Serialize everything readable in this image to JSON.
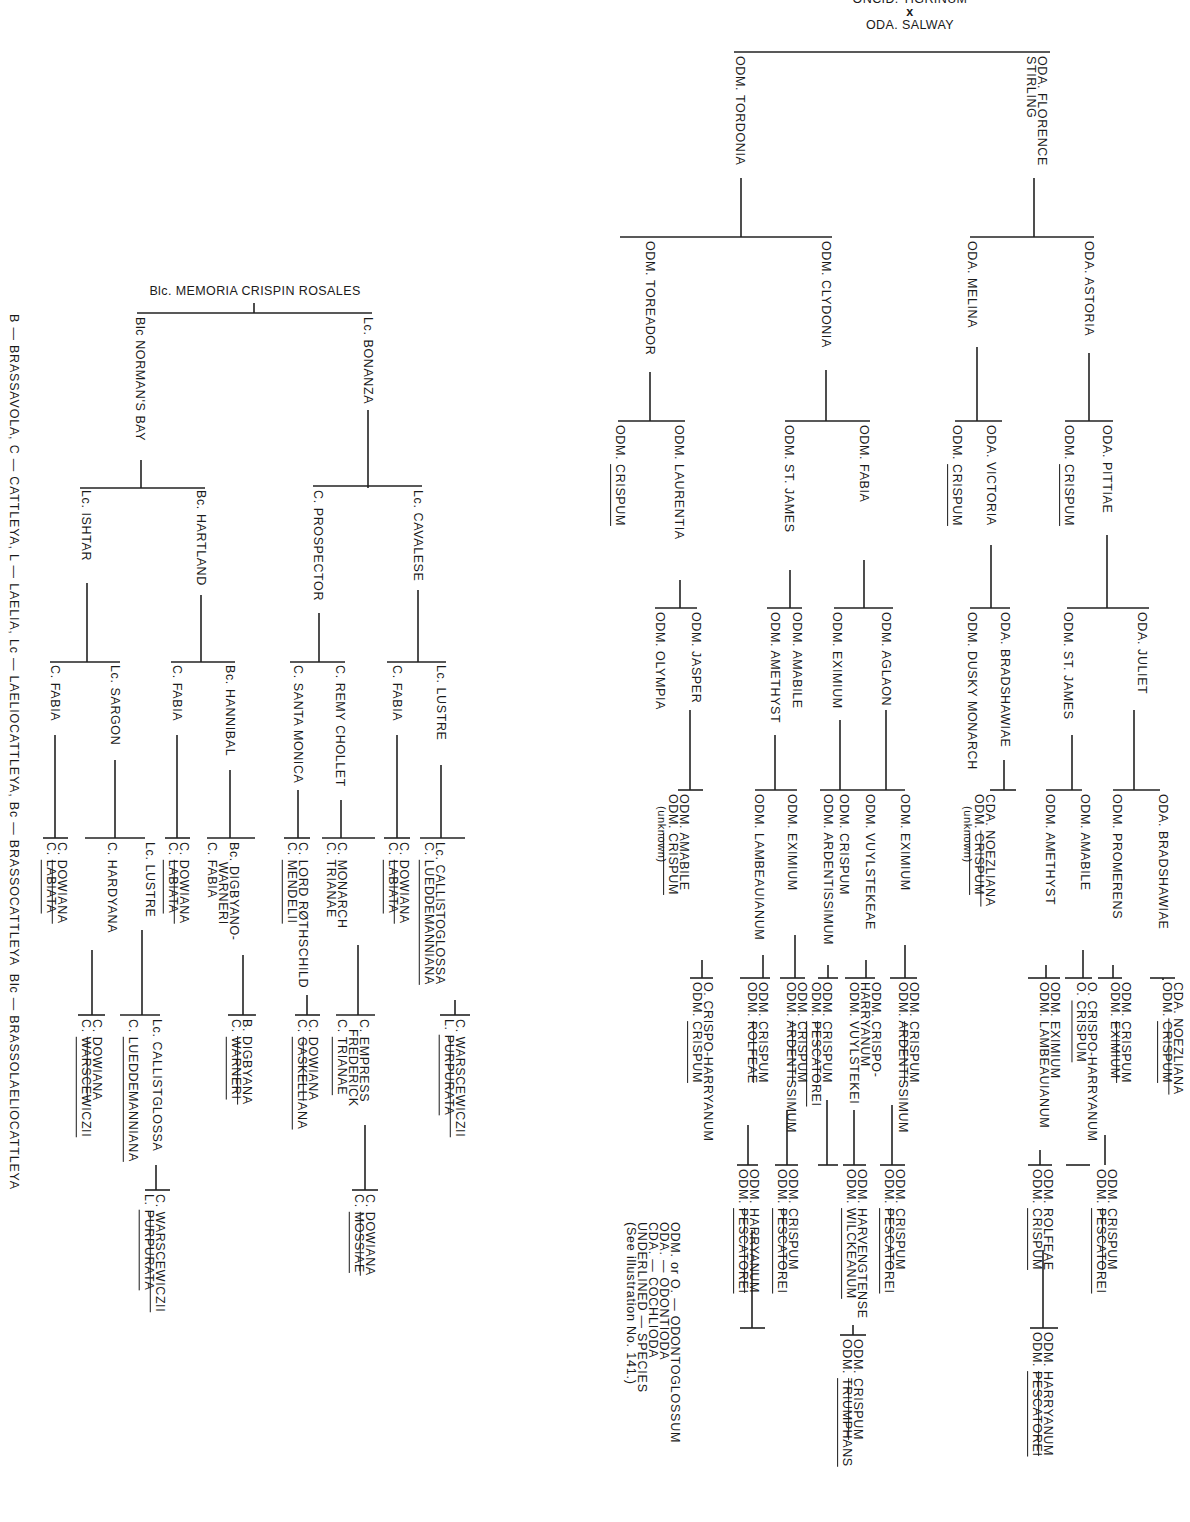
{
  "right_tree": {
    "title_top": "ONCID. TIGRINUM",
    "cross_symbol": "x",
    "title_bottom": "ODA. SALWAY",
    "gen1": [
      {
        "label": "ODA. FLORENCE\nSTIRLING"
      },
      {
        "label": "ODM. TORDONIA"
      }
    ],
    "gen2": [
      {
        "label": "ODA. ASTORIA"
      },
      {
        "label": "ODA. MELINA"
      },
      {
        "label": "ODM. CLYDONIA"
      },
      {
        "label": "ODM. TOREADOR"
      }
    ],
    "gen3": [
      {
        "label": "ODA. PITTIAE"
      },
      {
        "prefix": "ODM. ",
        "species": "CRISPUM"
      },
      {
        "label": "ODA. VICTORIA"
      },
      {
        "prefix": "ODM. ",
        "species": "CRISPUM"
      },
      {
        "label": "ODM. FABIA"
      },
      {
        "label": "ODM. ST. JAMES"
      },
      {
        "label": "ODM. LAURENTIA"
      },
      {
        "prefix": "ODM. ",
        "species": "CRISPUM"
      }
    ],
    "gen4": [
      {
        "label": "ODA. JULIET"
      },
      {
        "label": "ODM. ST. JAMES"
      },
      {
        "label": "ODA. BRADSHAWIAE"
      },
      {
        "label": "ODM. DUSKY MONARCH"
      },
      {
        "label": "ODM. AGLAON"
      },
      {
        "label": "ODM. EXIMIUM"
      },
      {
        "label": "ODM. AMABILE"
      },
      {
        "label": "ODM. AMETHYST"
      },
      {
        "label": "ODM. JASPER"
      },
      {
        "label": "ODM. OLYMPIA"
      }
    ],
    "gen5": [
      {
        "label": "ODA. BRADSHAWIAE"
      },
      {
        "label": "ODM. PROMERENS"
      },
      {
        "label": "ODM. AMABILE"
      },
      {
        "label": "ODM. AMETHYST"
      },
      {
        "line1_prefix": "CDA. ",
        "line1_species": "NOEZLIANA",
        "line2_prefix": "ODM. ",
        "line2_species": "CRISPUM",
        "note": "(unknown)"
      },
      {
        "label": "ODM. EXIMIUM"
      },
      {
        "label": "ODM. VUYLSTEKEAE"
      },
      {
        "label": "ODM. CRISPUM"
      },
      {
        "label": "ODM. ARDENTISSIMUM"
      },
      {
        "label": "ODM. EXIMIUM"
      },
      {
        "label": "ODM. LAMBEAUIANUM"
      },
      {
        "line1": "ODM. AMABILE",
        "line2_prefix": "ODM. ",
        "line2_species": "CRISPUM",
        "note": "(unknown)"
      }
    ],
    "gen6": {
      "bradshawiae_parents": {
        "line1_prefix": "CDA. ",
        "line1_species": "NOEZLIANA",
        "line2_prefix": "ODM. ",
        "line2_species": "CRISPUM"
      },
      "promerens_parents": {
        "line1_prefix": "ODM. ",
        "line1_species": "CRISPUM",
        "line2": "ODM. EXIMIUM"
      },
      "amabile_parents": {
        "line1": "O. CRISPO-HARRYANUM",
        "line2_prefix": "O. ",
        "line2_species": "CRISPUM"
      },
      "amethyst_parents": {
        "line1": "ODM. EXIMIUM",
        "line2": "ODM. LAMBEAUIANUM"
      },
      "eximium_parents_a": {
        "line1_prefix": "ODM. ",
        "line1_species": "CRISPUM",
        "line2": "ODM. ARDENTISSIMUM"
      },
      "vuylstekeae_parents": {
        "line1": "ODM. CRISPO-",
        "line1b": "HARRYANUM",
        "line2": "ODM. VUYLSTEKEI"
      },
      "eximium_parents_b": {
        "line1_prefix": "ODM. ",
        "line1_species": "CRISPUM",
        "line2": "ODM. ARDENTISSIMUM"
      },
      "ardentissimum_parents": {
        "line1_prefix": "ODM. ",
        "line1_species": "CRISPUM",
        "line2_prefix": "ODM. ",
        "line2_species": "PESCATOREI"
      },
      "lambeauianum_parents": {
        "line1_prefix": "ODM. ",
        "line1_species": "CRISPUM",
        "line2": "ODM. ROLFEAE"
      },
      "eximium_parents_c": {
        "line1_prefix": "ODM. ",
        "line1_species": "CRISPUM",
        "line2": "ODM. ARDENTISSIMUM"
      },
      "amabile_parents_b": {
        "line1": "O. CRISPO-HARRYANUM",
        "line2_prefix": "ODM. ",
        "line2_species": "CRISPUM"
      }
    },
    "gen7": {
      "eximium_a": {
        "line1_prefix": "ODM. ",
        "line1_species": "CRISPUM",
        "line2": "ODM. ARDENTISSIMUM"
      },
      "lambeauianum_a": {
        "line1": "ODM. ROLFEAE",
        "line2_prefix": "ODM. ",
        "line2_species": "CRISPUM"
      },
      "ardentissimum_a": {
        "line1_prefix": "ODM. ",
        "line1_species": "CRISPUM",
        "line2_prefix": "ODM. ",
        "line2_species": "PESCATOREI"
      },
      "vuylstekei": {
        "line1": "ODM. HARVENGTENSE",
        "line2_prefix": "ODM. ",
        "line2_species": "WILCKEANUM"
      },
      "ardentissimum_b": {
        "line1_prefix": "ODM. ",
        "line1_species": "CRISPUM",
        "line2_prefix": "ODM. ",
        "line2_species": "PESCATOREI"
      },
      "ardentissimum_c": {
        "line1_prefix": "ODM. ",
        "line1_species": "CRISPUM",
        "line2_prefix": "ODM. ",
        "line2_species": "PESCATOREI"
      },
      "rolfeae": {
        "line1_prefix": "ODM. ",
        "line1_species": "HARRYANUM",
        "line2_prefix": "ODM. ",
        "line2_species": "PESCATOREI"
      }
    },
    "gen8": {
      "rolfeae_a": {
        "line1_prefix": "ODM. ",
        "line1_species": "HARRYANUM",
        "line2_prefix": "ODM. ",
        "line2_species": "PESCATOREI"
      },
      "harvengtense": {
        "line1_prefix": "ODM. ",
        "line1_species": "CRISPUM",
        "line2_prefix": "ODM. ",
        "line2_species": "TRIUMPHANS"
      }
    },
    "legend": [
      "ODM. or O. — ODONTOGLOSSUM",
      "ODA. — ODONTIODA",
      "CDA. — COCHLIODA",
      "UNDERLINED — SPECIES",
      "(See illustration No. 141.)"
    ]
  },
  "left_tree": {
    "title": "Blc. MEMORIA CRISPIN ROSALES",
    "gen1": [
      {
        "label": "Lc. BONANZA"
      },
      {
        "label": "Blc NORMAN'S BAY"
      }
    ],
    "gen2": [
      {
        "label": "Lc. CAVALESE"
      },
      {
        "label": "C. PROSPECTOR"
      },
      {
        "label": "Bc. HARTLAND"
      },
      {
        "label": "Lc. ISHTAR"
      }
    ],
    "gen3": [
      {
        "label": "Lc. LUSTRE"
      },
      {
        "label": "C. FABIA"
      },
      {
        "label": "C. REMY CHOLLET"
      },
      {
        "label": "C. SANTA MONICA"
      },
      {
        "label": "Bc. HANNIBAL"
      },
      {
        "label": "C. FABIA"
      },
      {
        "label": "Lc. SARGON"
      },
      {
        "label": "C. FABIA"
      }
    ],
    "gen4": {
      "lustre": {
        "line1": "Lc. CALLISTOGLOSSA",
        "line2_prefix": "C. ",
        "line2_species": "LUEDDEMANNIANA"
      },
      "fabia_a": {
        "line1_prefix": "C. ",
        "line1_species": "DOWIANA",
        "line2_prefix": "C. ",
        "line2_species": "LABIATA"
      },
      "remy": {
        "line1": "C. MONARCH",
        "line2": "C. TRIANAE"
      },
      "santa_monica": {
        "line1": "C. LORD RØTHSCHILD",
        "line2_prefix": "C. ",
        "line2_species": "MENDELII"
      },
      "hannibal": {
        "line1": "Bc. DIGBYANO-",
        "line1b": "WARNERI",
        "line2": "C. FABIA"
      },
      "fabia_b": {
        "line1_prefix": "C. ",
        "line1_species": "DOWIANA",
        "line2_prefix": "C. ",
        "line2_species": "LABIATA"
      },
      "sargon": {
        "line1": "Lc. LUSTRE",
        "line2": "C. HARDYANA"
      },
      "fabia_c": {
        "line1_prefix": "C. ",
        "line1_species": "DOWIANA",
        "line2_prefix": "C. ",
        "line2_species": "LABIATA"
      }
    },
    "gen5": {
      "callistoglossa_a": {
        "line1_prefix": "C. ",
        "line1_species": "WARSCEWICZII",
        "line2_prefix": "L. ",
        "line2_species": "PURPURATA"
      },
      "monarch": {
        "line1": "C. EMPRESS",
        "line1b": "FREDERICK",
        "line2_prefix": "C. ",
        "line2_species": "TRIANAE"
      },
      "lord_rothschild": {
        "line1_prefix": "C. ",
        "line1_species": "DOWIANA",
        "line2_prefix": "C. ",
        "line2_species": "GASKELLIANA"
      },
      "digbyano": {
        "line1_prefix": "B. ",
        "line1_species": "DIGBYANA",
        "line2_prefix": "C. ",
        "line2_species": "WARNERI"
      },
      "lustre_b": {
        "line1": "Lc. CALLISTGLOSSA",
        "line2_prefix": "C. ",
        "line2_species": "LUEDDEMANNIANA"
      },
      "hardyana": {
        "line1_prefix": "C. ",
        "line1_species": "DOWIANA",
        "line2_prefix": "C. ",
        "line2_species": "WARSCEWICZII"
      }
    },
    "gen6": {
      "empress": {
        "line1_prefix": "C. ",
        "line1_species": "DOWIANA",
        "line2_prefix": "C. ",
        "line2_species": "MOSSIAE"
      },
      "callistglossa_b": {
        "line1_prefix": "C. ",
        "line1_species": "WARSCEWICZII",
        "line2_prefix": "L. ",
        "line2_species": "PURPURATA"
      }
    },
    "legend": "B — BRASSAVOLA, C — CATTLEYA, L — LAELIA, Lc — LAELIOCATTLEYA, Bc — BRASSOCATTLEYA  Blc — BRASSOLAELIOCATTLEYA"
  }
}
